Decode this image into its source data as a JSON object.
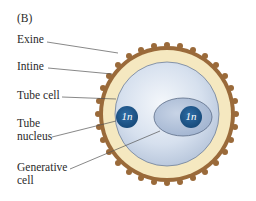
{
  "figure": {
    "panel_label": "(B)",
    "labels": {
      "exine": "Exine",
      "intine": "Intine",
      "tube_cell": "Tube cell",
      "tube_nucleus_line1": "Tube",
      "tube_nucleus_line2": "nucleus",
      "generative_cell_line1": "Generative",
      "generative_cell_line2": "cell"
    },
    "nuclei": {
      "tube_nucleus_ploidy": "1n",
      "generative_nucleus_ploidy": "1n"
    }
  },
  "colors": {
    "exine": "#9a6a3a",
    "intine": "#f5e8c0",
    "tube_cell": "#d4dfee",
    "generative_cell": "#aebfd8",
    "nucleus": "#1f5a8e",
    "leader_line": "#555555"
  }
}
